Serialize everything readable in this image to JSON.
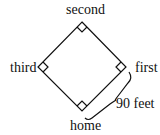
{
  "diagram": {
    "bases": {
      "second": "second",
      "third": "third",
      "first": "first",
      "home": "home"
    },
    "distance_label": "90 feet",
    "colors": {
      "line": "#111111",
      "background": "#ffffff"
    }
  }
}
